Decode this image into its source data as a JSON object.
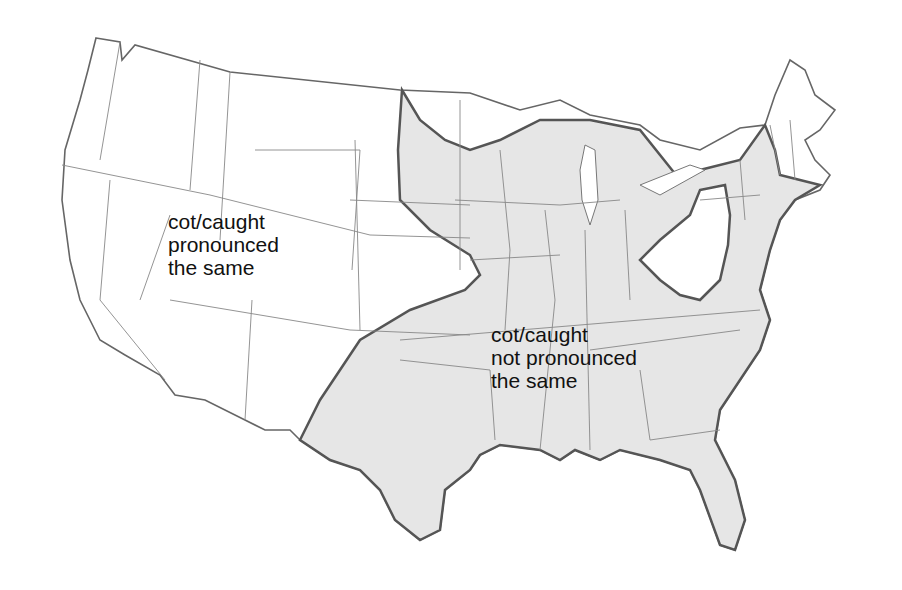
{
  "map": {
    "subject": "Contiguous United States",
    "background_color": "#ffffff",
    "region_fill_color": "#e8e8e8",
    "state_border_color": "#777777",
    "region_border_color": "#555555",
    "regions": [
      {
        "id": "merger",
        "label": "cot/caught\npronounced\nthe same",
        "fill": "#ffffff",
        "area": "West, Upper Plains, western Pennsylvania / West Virginia pocket, northern New England"
      },
      {
        "id": "no-merger",
        "label": "cot/caught\nnot pronounced\nthe same",
        "fill": "#e8e8e8",
        "area": "Midwest, South, Mid-Atlantic, New York, southern New England"
      }
    ]
  }
}
